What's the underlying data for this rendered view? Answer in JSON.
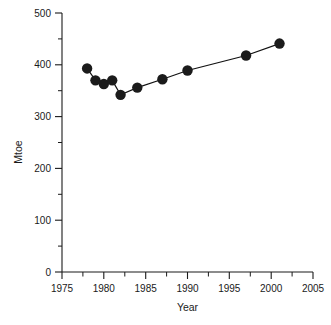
{
  "chart_data": {
    "type": "line",
    "title": "",
    "subtitle": "",
    "xlabel": "Year",
    "ylabel": "Mtoe",
    "xlim": [
      1975,
      2005
    ],
    "ylim": [
      0,
      500
    ],
    "grid": false,
    "legend": null,
    "x_major_ticks": [
      1975,
      1980,
      1985,
      1990,
      1995,
      2000,
      2005
    ],
    "x_tick_labels": [
      "1975",
      "1980",
      "1985",
      "1990",
      "1995",
      "2000",
      "2005"
    ],
    "x_minor_ticks": [
      1977.5,
      1982.5,
      1987.5,
      1992.5,
      1997.5,
      2002.5
    ],
    "y_major_ticks": [
      0,
      100,
      200,
      300,
      400,
      500
    ],
    "y_tick_labels": [
      "0",
      "100",
      "200",
      "300",
      "400",
      "500"
    ],
    "y_minor_ticks": [
      50,
      150,
      250,
      350,
      450
    ],
    "marker": "filled-circle",
    "marker_size": 5.2,
    "line_color": "#111111",
    "marker_color": "#1b1b1b",
    "series": [
      {
        "name": "Mtoe",
        "x": [
          1978,
          1979,
          1980,
          1981,
          1982,
          1984,
          1987,
          1990,
          1997,
          2001
        ],
        "values": [
          393,
          370,
          363,
          370,
          342,
          356,
          372,
          389,
          418,
          441
        ]
      }
    ]
  },
  "axes": {
    "y_axis_name": "y-axis",
    "x_axis_name": "x-axis"
  }
}
